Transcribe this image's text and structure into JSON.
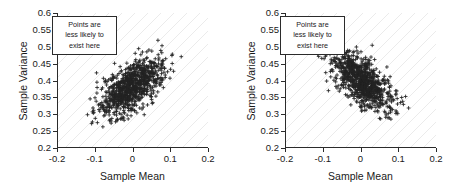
{
  "figure": {
    "background": "#ffffff",
    "marker_color": "#242424",
    "axis_color": "#2b2b2b",
    "grid_color": "#e2e2e2"
  },
  "annotation": {
    "line1": "Points are",
    "line2": "less likely to",
    "line3": "exist here"
  },
  "chart_data": [
    {
      "type": "scatter",
      "title": "",
      "xlabel": "Sample Mean",
      "ylabel": "Sample Variance",
      "xlim": [
        -0.2,
        0.2
      ],
      "ylim": [
        0.2,
        0.6
      ],
      "xticks": [
        -0.2,
        -0.1,
        0,
        0.1,
        0.2
      ],
      "xticklabels": [
        "-0.2",
        "-0.1",
        "0",
        "0.1",
        "0.2"
      ],
      "yticks": [
        0.2,
        0.25,
        0.3,
        0.35,
        0.4,
        0.45,
        0.5,
        0.55,
        0.6
      ],
      "yticklabels": [
        "0.2",
        "0.25",
        "0.3",
        "0.35",
        "0.4",
        "0.45",
        "0.5",
        "0.55",
        "0.6"
      ],
      "grid": "diagonal-hatch-45deg",
      "legend": "none",
      "marker": "+",
      "n_points": 900,
      "correlation": 0.62,
      "center": [
        -0.002,
        0.381
      ],
      "spread": [
        0.042,
        0.042
      ],
      "annotation_text": "Points are less likely to exist here",
      "annotation_position": "upper-left"
    },
    {
      "type": "scatter",
      "title": "",
      "xlabel": "Sample Mean",
      "ylabel": "Sample Variance",
      "xlim": [
        -0.2,
        0.2
      ],
      "ylim": [
        0.2,
        0.6
      ],
      "xticks": [
        -0.2,
        -0.1,
        0,
        0.1,
        0.2
      ],
      "xticklabels": [
        "-0.2",
        "-0.1",
        "0",
        "0.1",
        "0.2"
      ],
      "yticks": [
        0.2,
        0.25,
        0.3,
        0.35,
        0.4,
        0.45,
        0.5,
        0.55,
        0.6
      ],
      "yticklabels": [
        "0.2",
        "0.25",
        "0.3",
        "0.35",
        "0.4",
        "0.45",
        "0.5",
        "0.55",
        "0.6"
      ],
      "grid": "diagonal-hatch-45deg",
      "legend": "none",
      "marker": "+",
      "n_points": 900,
      "correlation": -0.62,
      "center": [
        0.003,
        0.398
      ],
      "spread": [
        0.04,
        0.044
      ],
      "annotation_text": "Points are less likely to exist here",
      "annotation_position": "upper-left"
    }
  ]
}
